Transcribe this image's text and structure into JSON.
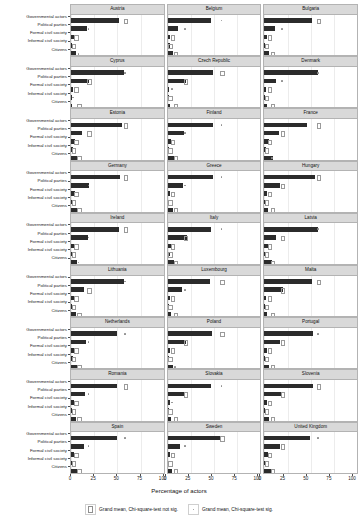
{
  "chart_data": {
    "type": "bar",
    "orientation": "horizontal",
    "title": "",
    "xlabel": "Percentage of actors",
    "ylabel": "",
    "xlim": [
      0,
      100
    ],
    "xticks": [
      0,
      25,
      50,
      75,
      100
    ],
    "xticklabels": [
      "0",
      "25",
      "50",
      "75",
      "100"
    ],
    "grid": true,
    "legend_position": "bottom",
    "facet_layout": {
      "rows": 9,
      "cols": 3
    },
    "categories": [
      "Governmental actors",
      "Political parties",
      "Formal civil society",
      "Informal civil society",
      "Citizens"
    ],
    "legend": [
      {
        "key": "not-sig",
        "label": "Grand mean, Chi-square-test not sig.",
        "marker": "open-square"
      },
      {
        "key": "sig",
        "label": "Grand mean, Chi-square-test sig.",
        "marker": "dot"
      }
    ],
    "panels": [
      {
        "name": "Austria",
        "values": [
          52,
          17,
          3,
          1,
          5
        ],
        "grand_mean": [
          58,
          19,
          5,
          2,
          8
        ],
        "sig": [
          false,
          true,
          false,
          false,
          true
        ]
      },
      {
        "name": "Belgium",
        "values": [
          47,
          11,
          3,
          2,
          6
        ],
        "grand_mean": [
          58,
          19,
          5,
          2,
          8
        ],
        "sig": [
          true,
          true,
          false,
          false,
          false
        ]
      },
      {
        "name": "Bulgaria",
        "values": [
          51,
          12,
          3,
          1,
          5
        ],
        "grand_mean": [
          58,
          19,
          5,
          2,
          8
        ],
        "sig": [
          false,
          true,
          false,
          false,
          false
        ]
      },
      {
        "name": "Cyprus",
        "values": [
          57,
          19,
          2,
          1,
          1
        ],
        "grand_mean": [
          58,
          19,
          5,
          2,
          8
        ],
        "sig": [
          true,
          false,
          false,
          true,
          false
        ]
      },
      {
        "name": "Czech Republic",
        "values": [
          49,
          20,
          1,
          1,
          2
        ],
        "grand_mean": [
          58,
          19,
          5,
          2,
          8
        ],
        "sig": [
          false,
          false,
          true,
          false,
          false
        ]
      },
      {
        "name": "Denmark",
        "values": [
          58,
          13,
          2,
          1,
          3
        ],
        "grand_mean": [
          58,
          19,
          5,
          2,
          8
        ],
        "sig": [
          true,
          true,
          false,
          false,
          false
        ]
      },
      {
        "name": "Estonia",
        "values": [
          55,
          12,
          4,
          2,
          6
        ],
        "grand_mean": [
          58,
          19,
          5,
          2,
          8
        ],
        "sig": [
          false,
          false,
          false,
          false,
          false
        ]
      },
      {
        "name": "Finland",
        "values": [
          49,
          18,
          4,
          1,
          7
        ],
        "grand_mean": [
          58,
          19,
          5,
          2,
          8
        ],
        "sig": [
          true,
          true,
          false,
          false,
          false
        ]
      },
      {
        "name": "France",
        "values": [
          46,
          16,
          5,
          2,
          9
        ],
        "grand_mean": [
          58,
          19,
          5,
          2,
          8
        ],
        "sig": [
          false,
          false,
          false,
          false,
          true
        ]
      },
      {
        "name": "Germany",
        "values": [
          53,
          19,
          4,
          2,
          7
        ],
        "grand_mean": [
          58,
          19,
          5,
          2,
          8
        ],
        "sig": [
          false,
          true,
          false,
          false,
          false
        ]
      },
      {
        "name": "Greece",
        "values": [
          49,
          17,
          3,
          1,
          6
        ],
        "grand_mean": [
          58,
          19,
          5,
          2,
          8
        ],
        "sig": [
          true,
          true,
          false,
          false,
          false
        ]
      },
      {
        "name": "Hungary",
        "values": [
          55,
          17,
          3,
          1,
          4
        ],
        "grand_mean": [
          58,
          19,
          5,
          2,
          8
        ],
        "sig": [
          false,
          false,
          false,
          false,
          false
        ]
      },
      {
        "name": "Ireland",
        "values": [
          52,
          18,
          4,
          1,
          6
        ],
        "grand_mean": [
          58,
          19,
          5,
          2,
          8
        ],
        "sig": [
          false,
          true,
          false,
          false,
          true
        ]
      },
      {
        "name": "Italy",
        "values": [
          47,
          21,
          4,
          2,
          7
        ],
        "grand_mean": [
          58,
          19,
          5,
          2,
          8
        ],
        "sig": [
          true,
          false,
          false,
          false,
          false
        ]
      },
      {
        "name": "Latvia",
        "values": [
          58,
          13,
          4,
          2,
          8
        ],
        "grand_mean": [
          58,
          19,
          5,
          2,
          8
        ],
        "sig": [
          true,
          false,
          false,
          false,
          false
        ]
      },
      {
        "name": "Lithuania",
        "values": [
          57,
          14,
          3,
          1,
          5
        ],
        "grand_mean": [
          58,
          19,
          5,
          2,
          8
        ],
        "sig": [
          true,
          false,
          false,
          false,
          false
        ]
      },
      {
        "name": "Luxembourg",
        "values": [
          46,
          15,
          3,
          1,
          4
        ],
        "grand_mean": [
          58,
          19,
          5,
          2,
          8
        ],
        "sig": [
          false,
          true,
          false,
          false,
          false
        ]
      },
      {
        "name": "Malta",
        "values": [
          51,
          20,
          2,
          1,
          3
        ],
        "grand_mean": [
          58,
          19,
          5,
          2,
          8
        ],
        "sig": [
          false,
          false,
          false,
          false,
          false
        ]
      },
      {
        "name": "Netherlands",
        "values": [
          50,
          16,
          4,
          2,
          7
        ],
        "grand_mean": [
          58,
          19,
          5,
          2,
          8
        ],
        "sig": [
          true,
          true,
          false,
          false,
          false
        ]
      },
      {
        "name": "Poland",
        "values": [
          48,
          20,
          3,
          1,
          6
        ],
        "grand_mean": [
          58,
          19,
          5,
          2,
          8
        ],
        "sig": [
          false,
          false,
          false,
          false,
          true
        ]
      },
      {
        "name": "Portugal",
        "values": [
          53,
          17,
          3,
          1,
          5
        ],
        "grand_mean": [
          58,
          19,
          5,
          2,
          8
        ],
        "sig": [
          true,
          false,
          false,
          false,
          false
        ]
      },
      {
        "name": "Romania",
        "values": [
          50,
          15,
          3,
          1,
          5
        ],
        "grand_mean": [
          58,
          19,
          5,
          2,
          8
        ],
        "sig": [
          false,
          true,
          false,
          false,
          false
        ]
      },
      {
        "name": "Slovakia",
        "values": [
          47,
          19,
          2,
          1,
          4
        ],
        "grand_mean": [
          58,
          19,
          5,
          2,
          8
        ],
        "sig": [
          true,
          false,
          true,
          false,
          false
        ]
      },
      {
        "name": "Slovenia",
        "values": [
          52,
          18,
          3,
          1,
          5
        ],
        "grand_mean": [
          58,
          19,
          5,
          2,
          8
        ],
        "sig": [
          false,
          false,
          false,
          false,
          false
        ]
      },
      {
        "name": "Spain",
        "values": [
          50,
          14,
          3,
          1,
          6
        ],
        "grand_mean": [
          58,
          19,
          5,
          2,
          8
        ],
        "sig": [
          true,
          true,
          false,
          false,
          false
        ]
      },
      {
        "name": "Sweden",
        "values": [
          56,
          13,
          3,
          1,
          5
        ],
        "grand_mean": [
          58,
          19,
          5,
          2,
          8
        ],
        "sig": [
          false,
          true,
          false,
          false,
          false
        ]
      },
      {
        "name": "United Kingdom",
        "values": [
          49,
          17,
          4,
          2,
          7
        ],
        "grand_mean": [
          58,
          19,
          5,
          2,
          8
        ],
        "sig": [
          true,
          false,
          false,
          false,
          false
        ]
      }
    ]
  }
}
